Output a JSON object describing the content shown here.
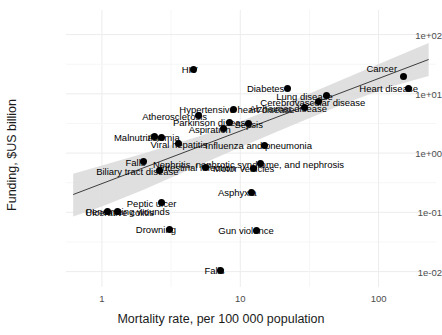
{
  "chart_data": {
    "type": "scatter",
    "title": "",
    "xlabel": "Mortality rate, per 100 000 population",
    "ylabel": "Funding, $US billion",
    "xscale": "log",
    "yscale": "log",
    "xlim": [
      0.55,
      260
    ],
    "ylim": [
      0.0055,
      260
    ],
    "xticks": [
      "1",
      "10",
      "100"
    ],
    "xtick_values": [
      1,
      10,
      100
    ],
    "yticks": [
      "1e+02",
      "1e+01",
      "1e+00",
      "1e-01",
      "1e-02"
    ],
    "ytick_values": [
      100,
      10,
      1,
      0.1,
      0.01
    ],
    "grid": true,
    "legend": "none",
    "regression": {
      "visible": true,
      "band_visible": true,
      "band_color": "#d9d9d9",
      "line_color": "#3d3d3d"
    },
    "points": [
      {
        "label": "Cancer",
        "x": 152.0,
        "y": 20.0,
        "label_dx": -22,
        "label_dy": -8
      },
      {
        "label": "Heart disease",
        "x": 165.0,
        "y": 12.5,
        "label_dx": -20,
        "label_dy": 0
      },
      {
        "label": "HIV",
        "x": 4.6,
        "y": 26.0,
        "label_dx": -4,
        "label_dy": 0
      },
      {
        "label": "Diabetes",
        "x": 22.0,
        "y": 12.5,
        "label_dx": -22,
        "label_dy": 0
      },
      {
        "label": "Lung disease",
        "x": 42.0,
        "y": 9.3,
        "label_dx": -22,
        "label_dy": 0
      },
      {
        "label": "Cerebrovascular disease",
        "x": 37.0,
        "y": 7.3,
        "label_dx": -6,
        "label_dy": 0
      },
      {
        "label": "Alzheimer disease",
        "x": 29.0,
        "y": 5.8,
        "label_dx": -16,
        "label_dy": 0
      },
      {
        "label": "Hypertensive heart disease",
        "x": 9.0,
        "y": 5.5,
        "label_dx": 3,
        "label_dy": 0
      },
      {
        "label": "Atherosclerosis",
        "x": 5.0,
        "y": 4.3,
        "label_dx": -24,
        "label_dy": 0
      },
      {
        "label": "Parkinson disease",
        "x": 8.4,
        "y": 3.3,
        "label_dx": -18,
        "label_dy": 0
      },
      {
        "label": "Sepsis",
        "x": 11.5,
        "y": 3.1,
        "label_dx": 0,
        "label_dy": 0
      },
      {
        "label": "Aspiration",
        "x": 7.6,
        "y": 2.6,
        "label_dx": -14,
        "label_dy": 0
      },
      {
        "label": "Malnutrition",
        "x": 2.4,
        "y": 1.9,
        "label_dx": -16,
        "label_dy": 0
      },
      {
        "label": "Anemia",
        "x": 2.7,
        "y": 1.85,
        "label_dx": 2,
        "label_dy": 0
      },
      {
        "label": "Viral hepatitis",
        "x": 3.6,
        "y": 1.45,
        "label_dx": 0,
        "label_dy": 0
      },
      {
        "label": "Influenza and pneumonia",
        "x": 15.0,
        "y": 1.35,
        "label_dx": -6,
        "label_dy": 0
      },
      {
        "label": "Falls",
        "x": 2.0,
        "y": 0.72,
        "label_dx": -8,
        "label_dy": 0
      },
      {
        "label": "Nephritis, nephrotic syndrome, and nephrosis",
        "x": 14.0,
        "y": 0.66,
        "label_dx": -12,
        "label_dy": 0
      },
      {
        "label": "Intestinal infection",
        "x": 5.6,
        "y": 0.58,
        "label_dx": -8,
        "label_dy": 0
      },
      {
        "label": "Motor vehicles",
        "x": 12.5,
        "y": 0.55,
        "label_dx": -10,
        "label_dy": 0
      },
      {
        "label": "Biliary tract disease",
        "x": 2.6,
        "y": 0.5,
        "label_dx": -22,
        "label_dy": 0
      },
      {
        "label": "Asphyxia",
        "x": 12.0,
        "y": 0.22,
        "label_dx": -14,
        "label_dy": 0
      },
      {
        "label": "Peptic ulcer",
        "x": 2.7,
        "y": 0.145,
        "label_dx": -10,
        "label_dy": 0
      },
      {
        "label": "Penetrating wounds",
        "x": 1.3,
        "y": 0.105,
        "label_dx": 10,
        "label_dy": 0
      },
      {
        "label": "Ulcerative colitis",
        "x": 1.1,
        "y": 0.103,
        "label_dx": 12,
        "label_dy": 0
      },
      {
        "label": "Drowning",
        "x": 3.1,
        "y": 0.052,
        "label_dx": -14,
        "label_dy": 0
      },
      {
        "label": "Gun violence",
        "x": 13.0,
        "y": 0.05,
        "label_dx": -10,
        "label_dy": 0
      },
      {
        "label": "Falls (low funding)",
        "x": 7.2,
        "y": 0.0105,
        "label_dx": -6,
        "label_dy": 0,
        "display_label": "Falls"
      }
    ],
    "band_upper": [
      {
        "x": 0.62,
        "y": 0.45
      },
      {
        "x": 1.0,
        "y": 0.62
      },
      {
        "x": 2.0,
        "y": 0.98
      },
      {
        "x": 5.0,
        "y": 1.9
      },
      {
        "x": 10.0,
        "y": 3.4
      },
      {
        "x": 25.0,
        "y": 8.0
      },
      {
        "x": 60.0,
        "y": 19.0
      },
      {
        "x": 120.0,
        "y": 38.0
      },
      {
        "x": 230.0,
        "y": 72.0
      }
    ],
    "band_lower": [
      {
        "x": 0.62,
        "y": 0.085
      },
      {
        "x": 1.0,
        "y": 0.125
      },
      {
        "x": 2.0,
        "y": 0.24
      },
      {
        "x": 5.0,
        "y": 0.62
      },
      {
        "x": 10.0,
        "y": 1.25
      },
      {
        "x": 25.0,
        "y": 3.1
      },
      {
        "x": 60.0,
        "y": 7.2
      },
      {
        "x": 120.0,
        "y": 13.0
      },
      {
        "x": 230.0,
        "y": 20.0
      }
    ],
    "fit_line": [
      {
        "x": 0.62,
        "y": 0.2
      },
      {
        "x": 230.0,
        "y": 38.0
      }
    ]
  }
}
